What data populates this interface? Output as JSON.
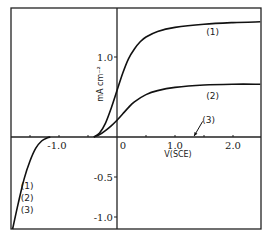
{
  "chart_data": {
    "type": "line",
    "title": "",
    "xlabel": "V(SCE)",
    "ylabel": "mA cm⁻²",
    "xlim": [
      -1.83,
      2.47
    ],
    "ylim": [
      -1.15,
      1.61
    ],
    "grid": false,
    "legend_position": "inline",
    "x_ticks": [
      {
        "value": -1.0,
        "label": "-1.0"
      },
      {
        "value": 0,
        "label": "0"
      },
      {
        "value": 1.0,
        "label": "1.0"
      },
      {
        "value": 2.0,
        "label": "2.0"
      }
    ],
    "y_ticks": [
      {
        "value": 1.0,
        "label": "1.0"
      },
      {
        "value": -0.5,
        "label": "-0.5"
      },
      {
        "value": -1.0,
        "label": "-1.0"
      }
    ],
    "series": [
      {
        "name": "(1)",
        "x": [
          -0.4,
          -0.3,
          -0.2,
          -0.1,
          0.0,
          0.1,
          0.2,
          0.3,
          0.4,
          0.5,
          0.7,
          1.0,
          1.5,
          2.0,
          2.47
        ],
        "values": [
          0.0,
          0.05,
          0.17,
          0.36,
          0.58,
          0.8,
          0.98,
          1.1,
          1.19,
          1.25,
          1.32,
          1.37,
          1.41,
          1.43,
          1.44
        ]
      },
      {
        "name": "(2)",
        "x": [
          -0.4,
          -0.3,
          -0.2,
          -0.1,
          0.0,
          0.1,
          0.2,
          0.3,
          0.5,
          0.7,
          1.0,
          1.5,
          2.0,
          2.47
        ],
        "values": [
          0.0,
          0.03,
          0.08,
          0.14,
          0.21,
          0.29,
          0.37,
          0.44,
          0.53,
          0.58,
          0.62,
          0.65,
          0.66,
          0.66
        ]
      },
      {
        "name": "(3)",
        "x": [
          -0.4,
          0.0,
          1.0,
          2.0,
          2.47
        ],
        "values": [
          0.0,
          0.0,
          0.0,
          0.0,
          0.0
        ]
      },
      {
        "name": "(1) (2) (3) cathodic",
        "x": [
          -1.8,
          -1.7,
          -1.6,
          -1.5,
          -1.4,
          -1.3,
          -1.2,
          -1.15
        ],
        "values": [
          -1.15,
          -0.82,
          -0.52,
          -0.3,
          -0.14,
          -0.05,
          -0.01,
          0.0
        ]
      }
    ],
    "annotations": [
      {
        "text": "(1)",
        "x": 1.65,
        "y": 1.27
      },
      {
        "text": "(2)",
        "x": 1.65,
        "y": 0.48
      },
      {
        "text": "(3)",
        "x": 1.58,
        "y": 0.17,
        "arrow_to": {
          "x": 1.33,
          "y": 0.0
        }
      },
      {
        "text": "(1)",
        "x": -1.55,
        "y": -0.65
      },
      {
        "text": "(2)",
        "x": -1.55,
        "y": -0.8
      },
      {
        "text": "(3)",
        "x": -1.55,
        "y": -0.95
      }
    ]
  },
  "plot": {
    "origin_px": [
      117,
      137
    ],
    "px_per_x": 58,
    "px_per_y": 80,
    "frame": {
      "left": 11,
      "top": 8,
      "right": 261,
      "bottom": 229
    },
    "line_color": "#111111",
    "axis_color": "#222222"
  }
}
